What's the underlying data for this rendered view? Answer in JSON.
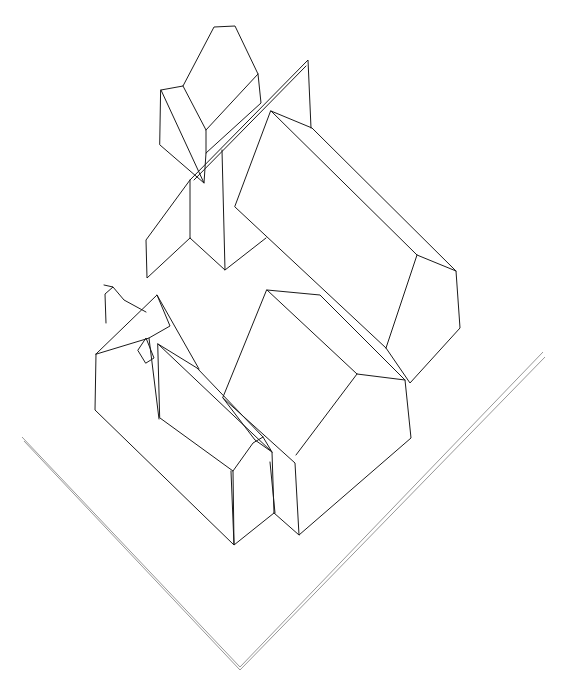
{
  "drawing": {
    "title": "Isometric sketch of building complex",
    "stroke_color": "#1a1a1a",
    "ground_color": "#8a8a8a",
    "background": "#ffffff",
    "elements": [
      {
        "name": "small-house-top-left"
      },
      {
        "name": "tall-gable-wall-with-wing"
      },
      {
        "name": "large-building-right"
      },
      {
        "name": "small-building-left-with-window"
      },
      {
        "name": "middle-long-building"
      },
      {
        "name": "front-right-building"
      },
      {
        "name": "ground-corner-lines"
      }
    ]
  },
  "caption": ""
}
